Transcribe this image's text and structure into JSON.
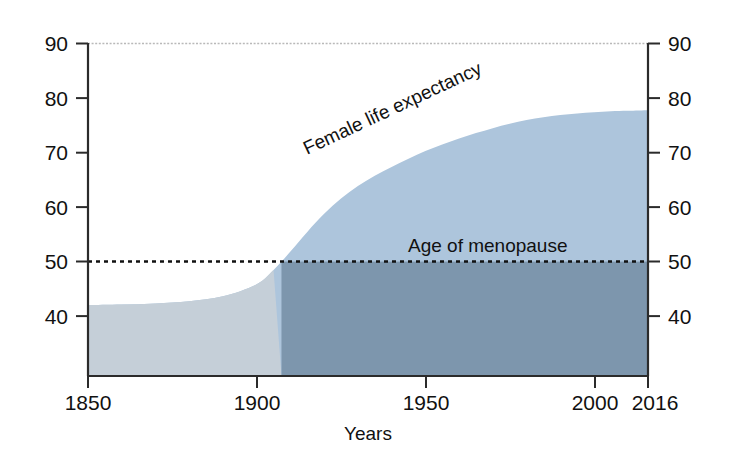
{
  "chart_data": {
    "type": "area",
    "title": "",
    "subtitle": "",
    "xlabel": "Years",
    "ylabel": "",
    "xlim": [
      1850,
      2016
    ],
    "ylim": [
      29,
      90
    ],
    "grid": false,
    "legend_position": "inline-annotations",
    "x_ticks": [
      "1850",
      "1900",
      "1950",
      "2000",
      "2016"
    ],
    "x_tick_values": [
      1850,
      1900,
      1950,
      2000,
      2016
    ],
    "y_ticks_left": [
      "90",
      "80",
      "70",
      "60",
      "50",
      "40"
    ],
    "y_ticks_right": [
      "90",
      "80",
      "70",
      "60",
      "50",
      "40"
    ],
    "y_tick_values": [
      90,
      80,
      70,
      60,
      50,
      40
    ],
    "series": [
      {
        "name": "Female life expectancy",
        "type": "area",
        "color": "#adc5dc",
        "x": [
          1850,
          1860,
          1870,
          1880,
          1890,
          1900,
          1905,
          1910,
          1915,
          1920,
          1925,
          1930,
          1935,
          1940,
          1945,
          1950,
          1955,
          1960,
          1965,
          1970,
          1975,
          1980,
          1985,
          1990,
          1995,
          2000,
          2005,
          2010,
          2016
        ],
        "values": [
          42.0,
          42.1,
          42.3,
          42.7,
          43.6,
          45.8,
          48.4,
          51.8,
          55.4,
          58.7,
          61.5,
          63.8,
          65.7,
          67.3,
          68.8,
          70.2,
          71.4,
          72.5,
          73.5,
          74.4,
          75.2,
          75.9,
          76.4,
          76.8,
          77.1,
          77.3,
          77.5,
          77.6,
          77.7
        ]
      },
      {
        "name": "Age of menopause",
        "type": "threshold-line",
        "color": "#111111",
        "value": 50,
        "style": "dotted"
      }
    ],
    "annotations": [
      {
        "text": "Female life expectancy",
        "x": 1925,
        "y": 68,
        "rotation": -24,
        "name": "female-life-expectancy-label"
      },
      {
        "text": "Age of menopause",
        "x": 1968,
        "y": 52,
        "rotation": 0,
        "name": "age-of-menopause-label"
      }
    ],
    "colors": {
      "area_above_threshold": "#adc5dc",
      "area_below_threshold_early": "#c5cfd8",
      "area_below_threshold_late": "#7d96ad",
      "axis": "#2b2b2b",
      "text": "#111111",
      "top_rule": "#b9b9b9",
      "background": "#ffffff"
    }
  },
  "axes": {
    "x_title": "Years",
    "ticks_x": [
      {
        "label": "1850",
        "value": 1850
      },
      {
        "label": "1900",
        "value": 1900
      },
      {
        "label": "1950",
        "value": 1950
      },
      {
        "label": "2000",
        "value": 2000
      },
      {
        "label": "2016",
        "value": 2016
      }
    ],
    "ticks_y": [
      {
        "label": "90",
        "value": 90
      },
      {
        "label": "80",
        "value": 80
      },
      {
        "label": "70",
        "value": 70
      },
      {
        "label": "60",
        "value": 60
      },
      {
        "label": "50",
        "value": 50
      },
      {
        "label": "40",
        "value": 40
      }
    ]
  },
  "labels": {
    "female_life_expectancy": "Female life expectancy",
    "age_of_menopause": "Age of menopause",
    "years": "Years"
  }
}
